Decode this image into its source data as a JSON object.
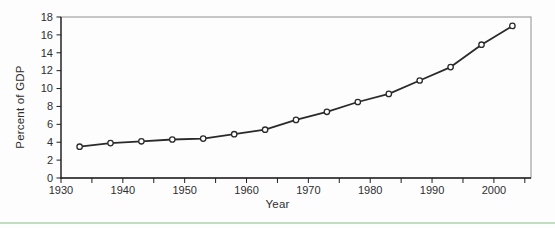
{
  "page": {
    "background_color": "#fdfdfd",
    "divider_color": "#c3ddc3"
  },
  "chart_data": {
    "type": "line",
    "title": "",
    "xlabel": "Year",
    "ylabel": "Percent of GDP",
    "series": [
      {
        "name": "Percent of GDP",
        "x": [
          1933,
          1938,
          1943,
          1948,
          1953,
          1958,
          1963,
          1968,
          1973,
          1978,
          1983,
          1988,
          1993,
          1998,
          2003
        ],
        "values": [
          3.5,
          3.9,
          4.1,
          4.3,
          4.4,
          4.9,
          5.4,
          6.5,
          7.4,
          8.5,
          9.4,
          10.9,
          12.4,
          14.9,
          17.0
        ]
      }
    ],
    "xlim": [
      1930,
      2006
    ],
    "ylim": [
      0,
      18
    ],
    "y_tick_labels": [
      "0",
      "2",
      "4",
      "6",
      "8",
      "10",
      "12",
      "14",
      "16",
      "18"
    ],
    "x_major_tick_labels": [
      "1930",
      "1940",
      "1950",
      "1960",
      "1970",
      "1980",
      "1990",
      "2000"
    ],
    "x_minor_ticks": [
      1935,
      1945,
      1955,
      1965,
      1975,
      1985,
      1995,
      2005
    ],
    "grid": false,
    "legend_position": "none",
    "marker_style": "open-circle",
    "line_color": "#2a2a2a",
    "marker_fill": "#ffffff",
    "frame_color": "#909090",
    "axis_color": "#1f1f1f",
    "text_color": "#2e2e2e"
  }
}
